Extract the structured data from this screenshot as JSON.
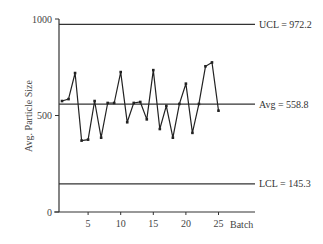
{
  "chart_data": {
    "type": "line",
    "title": "",
    "xlabel": "Batch",
    "ylabel": "Avg. Particle Size",
    "ylim": [
      0,
      1000
    ],
    "xlim": [
      0,
      26
    ],
    "y_ticks": [
      0,
      500,
      1000
    ],
    "x_ticks": [
      5,
      10,
      15,
      20,
      25
    ],
    "grid": false,
    "legend": null,
    "x": [
      1,
      2,
      3,
      4,
      5,
      6,
      7,
      8,
      9,
      10,
      11,
      12,
      13,
      14,
      15,
      16,
      17,
      18,
      19,
      20,
      21,
      22,
      23,
      24,
      25
    ],
    "series": [
      {
        "name": "Avg. Particle Size",
        "values": [
          575,
          585,
          720,
          370,
          375,
          575,
          385,
          565,
          565,
          725,
          465,
          565,
          570,
          480,
          735,
          430,
          550,
          385,
          560,
          665,
          410,
          560,
          755,
          775,
          525
        ]
      }
    ],
    "control_lines": [
      {
        "name": "UCL",
        "value": 972.2,
        "label": "UCL = 972.2"
      },
      {
        "name": "Avg",
        "value": 558.8,
        "label": "Avg = 558.8"
      },
      {
        "name": "LCL",
        "value": 145.3,
        "label": "LCL = 145.3"
      }
    ]
  }
}
